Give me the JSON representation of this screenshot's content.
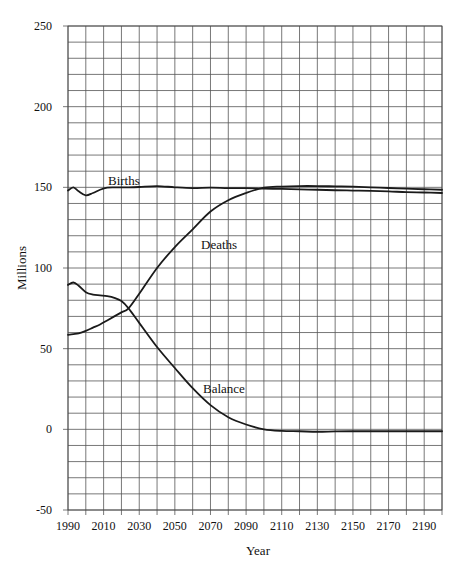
{
  "chart_data": {
    "type": "line",
    "title": "",
    "xlabel": "Year",
    "ylabel": "Millions",
    "xlim": [
      1990,
      2200
    ],
    "ylim": [
      -50,
      250
    ],
    "grid": true,
    "x_grid_step": 10,
    "y_grid_step": 10,
    "legend_position": "inline labels",
    "x_tick_labels": [
      "1990",
      "2010",
      "2030",
      "2050",
      "2070",
      "2090",
      "2110",
      "2130",
      "2150",
      "2170",
      "2190"
    ],
    "y_tick_labels": [
      "250",
      "200",
      "150",
      "100",
      "50",
      "0",
      "-50"
    ],
    "x": [
      1990,
      1993,
      1996,
      2000,
      2004,
      2008,
      2012,
      2016,
      2020,
      2024,
      2030,
      2040,
      2050,
      2060,
      2070,
      2080,
      2090,
      2100,
      2110,
      2120,
      2130,
      2140,
      2150,
      2160,
      2170,
      2180,
      2190,
      2200
    ],
    "series": [
      {
        "name": "Births",
        "label": "Births",
        "values": [
          148,
          150,
          147.5,
          145,
          146.5,
          148.5,
          149.8,
          150,
          150,
          150,
          150.2,
          150.8,
          150,
          149.5,
          149.8,
          149.5,
          149.5,
          149.2,
          149,
          148.7,
          148.5,
          148.2,
          148,
          147.8,
          147.5,
          147,
          146.8,
          146.5
        ]
      },
      {
        "name": "Deaths",
        "label": "Deaths",
        "values": [
          58.5,
          59,
          59.5,
          61,
          63,
          65,
          67.5,
          70,
          72.5,
          75,
          84,
          100,
          113,
          124,
          135,
          142,
          146.5,
          149.8,
          150.5,
          150.8,
          150.8,
          150.6,
          150.4,
          150,
          149.6,
          149.2,
          148.8,
          148.5
        ]
      },
      {
        "name": "Balance",
        "label": "Balance",
        "values": [
          89.5,
          91,
          89,
          85,
          83.5,
          83,
          82.5,
          81.5,
          79.5,
          75,
          66,
          51,
          38,
          25.5,
          15,
          7.5,
          3,
          0,
          -1,
          -1.2,
          -1.5,
          -1.3,
          -1.2,
          -1.2,
          -1.2,
          -1.2,
          -1.2,
          -1.2
        ]
      }
    ]
  },
  "labels": {
    "births": "Births",
    "deaths": "Deaths",
    "balance": "Balance",
    "xlabel": "Year",
    "ylabel": "Millions"
  }
}
